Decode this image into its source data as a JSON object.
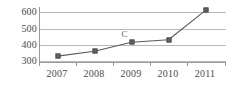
{
  "chart_data": {
    "type": "line",
    "title": "",
    "xlabel": "",
    "ylabel": "",
    "categories": [
      "2007",
      "2008",
      "2009",
      "2010",
      "2011"
    ],
    "values": [
      330,
      360,
      415,
      430,
      610
    ],
    "series": [
      {
        "name": "",
        "values": [
          330,
          360,
          415,
          430,
          610
        ]
      }
    ],
    "ylim": [
      300,
      650
    ],
    "yticks": [
      300,
      400,
      500,
      600
    ],
    "ytick_labels": [
      "300",
      "400",
      "500",
      "600"
    ],
    "grid": true,
    "legend": "none",
    "annotations": [
      {
        "text": "C",
        "category": "2009",
        "value": 415
      }
    ],
    "colors": {
      "line": "#5a5a5a",
      "marker": "#636363",
      "grid": "#b9b9b9",
      "axis": "#9a9a9a",
      "text": "#4a4a4a",
      "background": "#ffffff"
    }
  }
}
